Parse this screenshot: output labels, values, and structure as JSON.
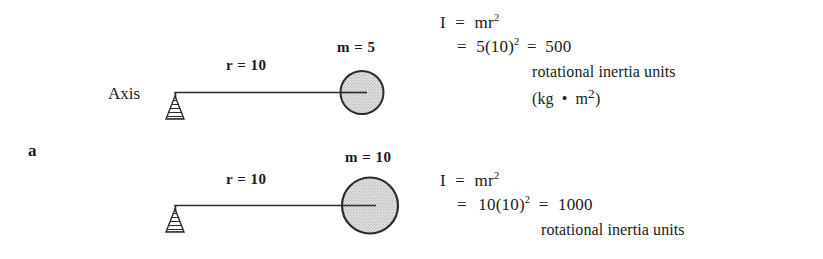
{
  "figure": {
    "panel_label": "a",
    "background_color": "#ffffff",
    "ink_color": "#1a1a1a",
    "mass_fill_color": "#d9d9d9"
  },
  "diagrams": [
    {
      "axis_label": "Axis",
      "radius_label": "r = 10",
      "mass_label": "m = 5",
      "pivot_icon": "hatched-triangle-support",
      "mass_icon": "stippled-circle"
    },
    {
      "axis_label": "",
      "radius_label": "r = 10",
      "mass_label": "m = 10",
      "pivot_icon": "hatched-triangle-support",
      "mass_icon": "stippled-circle"
    }
  ],
  "equations": [
    {
      "line1_lead": "I",
      "line1_eq": "=",
      "line1_expr_base": "mr",
      "line1_expr_exp": "2",
      "line2_eq": "=",
      "line2_left": "5(10)",
      "line2_left_exp": "2",
      "line2_eq2": "=",
      "line2_result": "500",
      "units_text": "rotational inertia units",
      "units_paren_open": "(kg",
      "units_dot": "•",
      "units_m": "m",
      "units_m_exp": "2",
      "units_paren_close": ")"
    },
    {
      "line1_lead": "I",
      "line1_eq": "=",
      "line1_expr_base": "mr",
      "line1_expr_exp": "2",
      "line2_eq": "=",
      "line2_left": "10(10)",
      "line2_left_exp": "2",
      "line2_eq2": "=",
      "line2_result": "1000",
      "units_text": "rotational inertia units",
      "units_paren_open": "",
      "units_dot": "",
      "units_m": "",
      "units_m_exp": "",
      "units_paren_close": ""
    }
  ]
}
